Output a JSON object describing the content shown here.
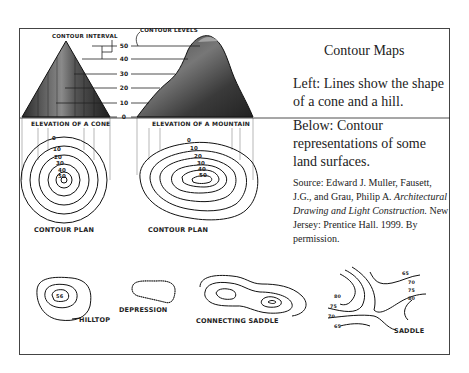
{
  "header": {
    "title": "Contour Maps"
  },
  "captions": {
    "left_description": "Left: Lines show the shape of a cone and a hill.",
    "below_description": "Below: Contour representations of some land surfaces.",
    "source_prefix": "Source: Edward J. Muller, Fausett, J.G., and Grau, Philip A. ",
    "source_title": "Architectural Drawing and Light Construction.",
    "source_suffix": " New Jersey: Prentice Hall. 1999. By permission."
  },
  "elevation_diagram": {
    "contour_interval_label": "CONTOUR INTERVAL",
    "contour_levels_label": "CONTOUR LEVELS",
    "levels": [
      "50",
      "40",
      "30",
      "20",
      "10",
      "0"
    ],
    "cone_label": "ELEVATION OF A CONE",
    "mountain_label": "ELEVATION OF A MOUNTAIN"
  },
  "cone_plan": {
    "labels": [
      "0",
      "10",
      "20",
      "30",
      "40",
      "50"
    ],
    "caption": "CONTOUR PLAN"
  },
  "mountain_plan": {
    "labels": [
      "0",
      "10",
      "20",
      "30",
      "40",
      "50"
    ],
    "caption": "CONTOUR PLAN"
  },
  "landforms": {
    "hilltop": {
      "label": "HILLTOP",
      "peak": "56"
    },
    "depression": {
      "label": "DEPRESSION"
    },
    "connecting_saddle": {
      "label": "CONNECTING SADDLE"
    },
    "saddle": {
      "label": "SADDLE",
      "left_levels": [
        "80",
        "75",
        "70",
        "65"
      ],
      "right_levels": [
        "65",
        "70",
        "75",
        "80"
      ]
    }
  }
}
